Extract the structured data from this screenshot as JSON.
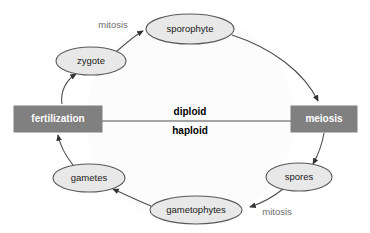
{
  "diagram": {
    "colors": {
      "background": "#ffffff",
      "box_fill": "#808080",
      "box_text": "#ffffff",
      "ellipse_fill": "#e8e8e8",
      "ellipse_stroke": "#595959",
      "ellipse_text": "#1a1a1a",
      "arrow_stroke": "#4d4d4d",
      "process_text": "#6e6e6e",
      "ploidy_text": "#000000",
      "divider_line": "#4d4d4d"
    },
    "boxes": [
      {
        "id": "fertilization",
        "label": "fertilization",
        "x": 14,
        "y": 106,
        "w": 88,
        "h": 26
      },
      {
        "id": "meiosis",
        "label": "meiosis",
        "x": 291,
        "y": 106,
        "w": 66,
        "h": 26
      }
    ],
    "ellipses": [
      {
        "id": "sporophyte",
        "label": "sporophyte",
        "cx": 190,
        "cy": 29,
        "rx": 44,
        "ry": 15
      },
      {
        "id": "zygote",
        "label": "zygote",
        "cx": 91,
        "cy": 61,
        "rx": 35,
        "ry": 14
      },
      {
        "id": "gametes",
        "label": "gametes",
        "cx": 89,
        "cy": 178,
        "rx": 36,
        "ry": 14
      },
      {
        "id": "gametophytes",
        "label": "gametophytes",
        "cx": 196,
        "cy": 210,
        "rx": 46,
        "ry": 14
      },
      {
        "id": "spores",
        "label": "spores",
        "cx": 299,
        "cy": 177,
        "rx": 33,
        "ry": 14
      }
    ],
    "ploidy": {
      "upper": "diploid",
      "lower": "haploid",
      "upper_x": 190,
      "upper_y": 112,
      "lower_x": 190,
      "lower_y": 131,
      "line_y": 121,
      "line_x1": 102,
      "line_x2": 291
    },
    "process_labels": [
      {
        "id": "mitosis-top",
        "label": "mitosis",
        "x": 113,
        "y": 25
      },
      {
        "id": "mitosis-bottom",
        "label": "mitosis",
        "x": 277,
        "y": 212
      }
    ],
    "arrows": [
      {
        "id": "fertilization-to-zygote",
        "from": "fertilization",
        "to": "zygote",
        "d": "M 62 104 C 60 92 66 80 76 74"
      },
      {
        "id": "zygote-to-sporophyte",
        "from": "zygote",
        "to": "sporophyte",
        "d": "M 116 52 C 126 43 134 36 143 31"
      },
      {
        "id": "sporophyte-to-meiosis",
        "from": "sporophyte",
        "to": "meiosis",
        "d": "M 232 35 C 272 48 304 72 318 101"
      },
      {
        "id": "meiosis-to-spores",
        "from": "meiosis",
        "to": "spores",
        "d": "M 324 133 C 322 145 318 155 313 164"
      },
      {
        "id": "spores-to-gametophytes",
        "from": "spores",
        "to": "gametophytes",
        "d": "M 283 189 C 272 198 262 203 250 207"
      },
      {
        "id": "gametophytes-to-gametes",
        "from": "gametophytes",
        "to": "gametes",
        "d": "M 151 206 C 138 201 126 195 113 189"
      },
      {
        "id": "gametes-to-fertilization",
        "from": "gametes",
        "to": "fertilization",
        "d": "M 73 165 C 65 155 60 145 58 135"
      }
    ]
  }
}
